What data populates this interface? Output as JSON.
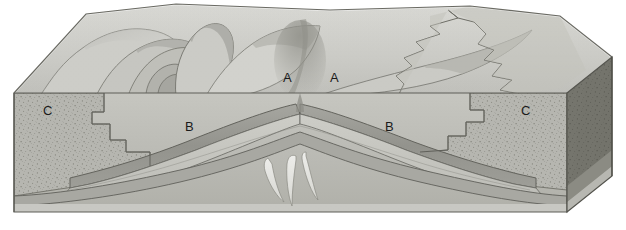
{
  "figure": {
    "kind": "geologic-block-diagram",
    "background_color": "#ffffff"
  },
  "labels": [
    {
      "id": "A-left",
      "text": "A",
      "x": 283,
      "y": 71,
      "surface": "top"
    },
    {
      "id": "A-right",
      "text": "A",
      "x": 330,
      "y": 71,
      "surface": "top"
    },
    {
      "id": "B-left",
      "text": "B",
      "x": 185,
      "y": 120,
      "surface": "front-face"
    },
    {
      "id": "B-right",
      "text": "B",
      "x": 385,
      "y": 120,
      "surface": "front-face"
    },
    {
      "id": "C-left",
      "text": "C",
      "x": 43,
      "y": 104,
      "surface": "front-face"
    },
    {
      "id": "C-right",
      "text": "C",
      "x": 521,
      "y": 104,
      "surface": "front-face"
    }
  ],
  "units": [
    {
      "code": "A",
      "name": "unit-a",
      "color": "#c9c9c5",
      "texture": "smooth",
      "note": "Light gray unit exposed in the fold limbs on the eroded top surface"
    },
    {
      "code": "B",
      "name": "unit-b",
      "color": "#9b9b97",
      "texture": "smooth",
      "note": "Medium gray marker bed arching over the anticline in cross-section"
    },
    {
      "code": "C",
      "name": "unit-c",
      "color": "#b4b4ae",
      "texture": "stippled",
      "note": "Stippled coarse-grained unit at the outer flanks of the front face"
    }
  ],
  "palette": {
    "paper": "#ffffff",
    "top_surface_light": "#d6d6d2",
    "top_surface_mid": "#c4c4bf",
    "top_surface_shadow": "#a9a9a4",
    "front_face_base": "#b9b9b3",
    "front_face_light": "#cfcfca",
    "front_face_dark": "#909089",
    "side_face_dark": "#77776f",
    "side_face_darker": "#66665f",
    "line_color": "#5a5a54",
    "line_soft": "#7c7c75",
    "core_wedge": "#e2e2dd",
    "label_color": "#1a1a1a"
  },
  "geometry": {
    "block_left_x": 14,
    "block_right_x": 612,
    "front_face_top_y": 93,
    "front_face_bottom_y": 212,
    "top_surface_back_y": 4,
    "side_face_offset_x": 52,
    "side_face_offset_y": -36
  }
}
